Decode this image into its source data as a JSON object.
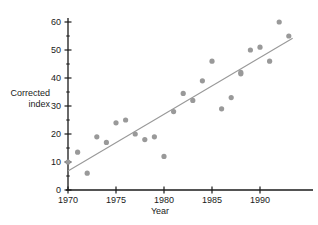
{
  "chart_data": {
    "type": "scatter",
    "title": "",
    "xlabel": "Year",
    "ylabel": "Corrected index",
    "ylabel_line1": "Corrected",
    "ylabel_line2": "index",
    "xlim": [
      1969.3,
      1993.6
    ],
    "ylim": [
      0,
      62
    ],
    "grid": false,
    "legend": null,
    "point_color": "#999999",
    "line_color": "#999999",
    "axis_color": "#1a1a1a",
    "x_ticks_major": [
      1970,
      1975,
      1980,
      1985,
      1990
    ],
    "x_tick_labels": [
      "1970",
      "1975",
      "1980",
      "1985",
      "1990"
    ],
    "y_ticks_major": [
      0,
      10,
      20,
      30,
      40,
      50,
      60
    ],
    "y_tick_labels": [
      "0",
      "10",
      "20",
      "30",
      "40",
      "50",
      "60"
    ],
    "y_ticks_minor": [
      5,
      15,
      25,
      35,
      45,
      55
    ],
    "series": [
      {
        "name": "Corrected index",
        "x": [
          1970,
          1971,
          1972,
          1973,
          1974,
          1975,
          1976,
          1977,
          1978,
          1979,
          1980,
          1981,
          1982,
          1983,
          1984,
          1985,
          1986,
          1987,
          1988,
          1988,
          1989,
          1990,
          1991,
          1992,
          1993
        ],
        "values": [
          10,
          13.5,
          6,
          19,
          17,
          24,
          25,
          20,
          18,
          19,
          12,
          28,
          34.5,
          32,
          39,
          46,
          29,
          33,
          41.5,
          42,
          50,
          51,
          46,
          60,
          55
        ]
      }
    ],
    "trend_line": {
      "type": "linear-fit",
      "x_start": 1970,
      "y_start": 6.8,
      "x_end": 1993.4,
      "y_end": 54.2
    }
  }
}
